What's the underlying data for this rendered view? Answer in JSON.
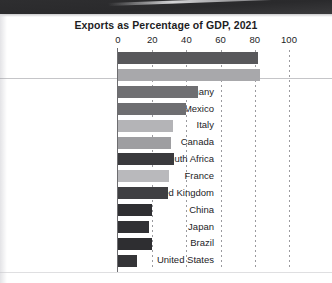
{
  "chart_data": {
    "type": "bar",
    "orientation": "horizontal",
    "title": "Exports as Percentage of GDP, 2021",
    "xlabel": "",
    "ylabel": "",
    "xlim": [
      0,
      100
    ],
    "xticks": [
      0,
      20,
      40,
      60,
      80,
      100
    ],
    "grid": "vertical-dotted",
    "legend": "none",
    "categories": [
      "Belgium",
      "Netherlands",
      "Germany",
      "Mexico",
      "Italy",
      "Canada",
      "South Africa",
      "France",
      "United Kingdom",
      "China",
      "Japan",
      "Brazil",
      "United States"
    ],
    "values": [
      82,
      83,
      47,
      40,
      32,
      31,
      33,
      30,
      29,
      20,
      18,
      20,
      11
    ],
    "bar_colors": [
      "#58585b",
      "#a8a8ab",
      "#6f6f72",
      "#6e6e71",
      "#b4b4b7",
      "#9e9ea1",
      "#3a3a3d",
      "#b9b9bc",
      "#3f3f42",
      "#2f2f32",
      "#313134",
      "#2e2e31",
      "#343437"
    ]
  },
  "axis": {
    "tick_labels": [
      "0",
      "20",
      "40",
      "60",
      "80",
      "100"
    ]
  }
}
